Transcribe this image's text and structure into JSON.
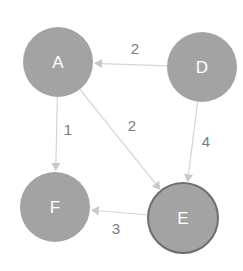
{
  "colors": {
    "node_fill": "#a3a3a3",
    "node_border_highlight": "#6e6e6e",
    "edge": "#d4d4d4",
    "arrow": "#c8c8c8",
    "edge_label": "#7a7a7a",
    "node_text": "#ffffff"
  },
  "nodes": [
    {
      "id": "A",
      "label": "A",
      "x": 58,
      "y": 62,
      "r": 35,
      "highlight": false
    },
    {
      "id": "D",
      "label": "D",
      "x": 202,
      "y": 67,
      "r": 35,
      "highlight": false
    },
    {
      "id": "F",
      "label": "F",
      "x": 55,
      "y": 207,
      "r": 35,
      "highlight": false
    },
    {
      "id": "E",
      "label": "E",
      "x": 183,
      "y": 218,
      "r": 35,
      "highlight": true
    }
  ],
  "edges": [
    {
      "from": "D",
      "to": "A",
      "weight": "2",
      "label_x": 135,
      "label_y": 48
    },
    {
      "from": "A",
      "to": "F",
      "weight": "1",
      "label_x": 68,
      "label_y": 129
    },
    {
      "from": "A",
      "to": "E",
      "weight": "2",
      "label_x": 132,
      "label_y": 125
    },
    {
      "from": "D",
      "to": "E",
      "weight": "4",
      "label_x": 206,
      "label_y": 141
    },
    {
      "from": "E",
      "to": "F",
      "weight": "3",
      "label_x": 116,
      "label_y": 228
    }
  ]
}
